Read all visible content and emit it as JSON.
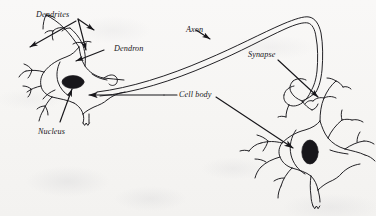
{
  "figure": {
    "medium": "scanned line drawing",
    "background_color": "#f7f6f4",
    "ink_color": "#17161a"
  },
  "labels": {
    "dendrites": "Dendrites",
    "dendron": "Dendron",
    "axon": "Axon",
    "synapse": "Synapse",
    "cell_body": "Cell body",
    "nucleus": "Nucleus"
  },
  "parts": {
    "left_neuron": "left-neuron",
    "right_neuron": "right-neuron",
    "axon_tube": "axon-tube",
    "left_nucleus": "left-nucleus",
    "right_nucleus": "right-nucleus",
    "synapse_terminal": "synapse-terminal"
  },
  "leader_lines": {
    "dendrites": "bracket with two arrowheads pointing to upper dendrite branches",
    "dendron": "straight line with arrowhead pointing left-down to dendron trunk",
    "axon": "short line with arrowhead pointing down-right to axon tube",
    "synapse": "straight line with arrowhead pointing down-right to synapse terminal",
    "cell_body": "horizontal line with arrowhead pointing left to left soma; diagonal line with arrowhead pointing down-right to right soma",
    "nucleus": "straight line with arrowhead pointing up-right to left nucleus"
  }
}
